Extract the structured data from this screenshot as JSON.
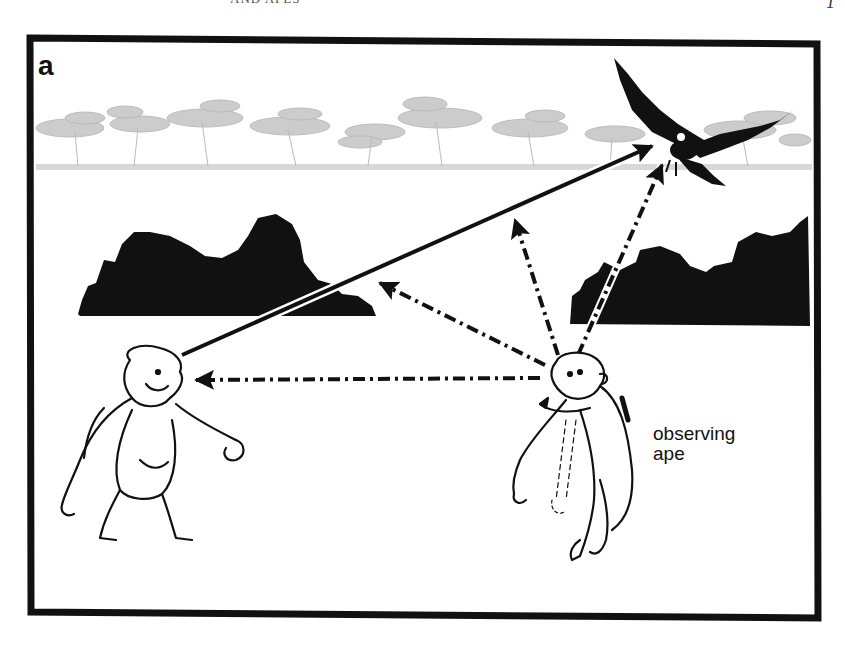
{
  "page": {
    "running_head": "AND APES",
    "page_number": "1"
  },
  "figure": {
    "panel_label": "a",
    "labels": {
      "observing_ape_line1": "observing",
      "observing_ape_line2": "ape"
    },
    "elements": [
      {
        "name": "background-tree-line",
        "description": "light gray acacia savanna tree line"
      },
      {
        "name": "bush-left",
        "description": "black bush silhouette, left"
      },
      {
        "name": "bush-right",
        "description": "black bush silhouette, right"
      },
      {
        "name": "bird-of-prey",
        "description": "black eagle silhouette, top right"
      },
      {
        "name": "signalling-ape",
        "description": "ape facing observer, left"
      },
      {
        "name": "observing-ape",
        "description": "ape turning head, right"
      }
    ],
    "arrows": [
      {
        "name": "gaze-arrow-signaller-to-bird",
        "style": "solid",
        "from": [
          182,
          355
        ],
        "to": [
          652,
          146
        ]
      },
      {
        "name": "gaze-arrow-observer-to-signaller",
        "style": "dash-dot",
        "from": [
          540,
          378
        ],
        "to": [
          192,
          380
        ]
      },
      {
        "name": "gaze-arrow-observer-to-bush",
        "style": "dash-dot",
        "from": [
          545,
          365
        ],
        "to": [
          378,
          282
        ]
      },
      {
        "name": "gaze-arrow-observer-up",
        "style": "dash-dot",
        "from": [
          558,
          355
        ],
        "to": [
          515,
          218
        ]
      },
      {
        "name": "gaze-arrow-observer-to-bird",
        "style": "dash-dot",
        "from": [
          578,
          355
        ],
        "to": [
          662,
          163
        ]
      }
    ],
    "colors": {
      "ink": "#111111",
      "trees": "#b8b8b8",
      "background": "#ffffff"
    }
  }
}
